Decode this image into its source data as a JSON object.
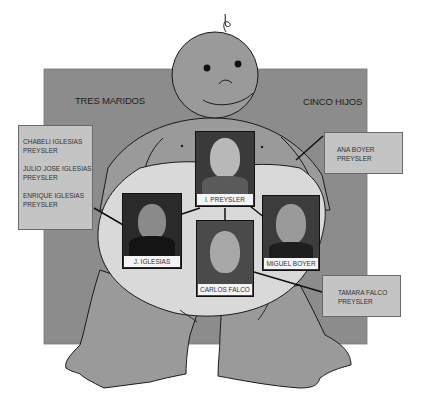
{
  "headings": {
    "left": "TRES MARIDOS",
    "right": "CINCO HIJOS"
  },
  "children": {
    "iglesias_box": [
      "CHABELI IGLESIAS PREYSLER",
      "JULIO JOSE IGLESIAS PREYSLER",
      "ENRIQUE IGLESIAS PREYSLER"
    ],
    "boyer_box": [
      "ANA BOYER PREYSLER"
    ],
    "falco_box": [
      "TAMARA FALCO PREYSLER"
    ]
  },
  "children_lines": {
    "iglesias_box": [
      "CHABELI IGLESIAS",
      "PREYSLER",
      "JULIO JOSE IGLESIAS",
      "PREYSLER",
      "ENRIQUE IGLESIAS",
      "PREYSLER"
    ],
    "boyer_box": [
      "ANA BOYER",
      "PREYSLER"
    ],
    "falco_box": [
      "TAMARA FALCO",
      "PREYSLER"
    ]
  },
  "photos": {
    "center": "I. PREYSLER",
    "husband1": "J. IGLESIAS",
    "husband2": "CARLOS FALCO",
    "husband3": "MIGUEL BOYER"
  },
  "colors": {
    "background_panel": "#8c8c8c",
    "figure_body": "#9a9a9a",
    "belly": "#d9d9d9",
    "child_box": "#c4c4c4",
    "outline": "#1a1a1a"
  }
}
